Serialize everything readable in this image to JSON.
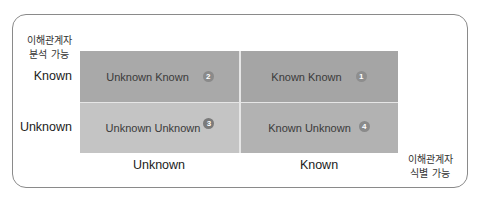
{
  "diagram": {
    "type": "2x2 matrix",
    "y_axis": {
      "title_line1": "이해관계자",
      "title_line2": "분석 가능",
      "rows": [
        "Known",
        "Unknown"
      ]
    },
    "x_axis": {
      "title_line1": "이해관계자",
      "title_line2": "식별 가능",
      "columns": [
        "Unknown",
        "Known"
      ]
    },
    "cells": [
      {
        "label": "Unknown Known",
        "number": "2",
        "row": "Known",
        "column": "Unknown",
        "color": "#a9a9a9",
        "badge_color": "#8a8a8a"
      },
      {
        "label": "Known Known",
        "number": "1",
        "row": "Known",
        "column": "Known",
        "color": "#a5a5a5",
        "badge_color": "#8e8e8e"
      },
      {
        "label": "Unknown Unknown",
        "number": "3",
        "row": "Unknown",
        "column": "Unknown",
        "color": "#c4c4c4",
        "badge_color": "#7a7a7a"
      },
      {
        "label": "Known Unknown",
        "number": "4",
        "row": "Unknown",
        "column": "Known",
        "color": "#b2b2b2",
        "badge_color": "#8a8a8a"
      }
    ]
  }
}
